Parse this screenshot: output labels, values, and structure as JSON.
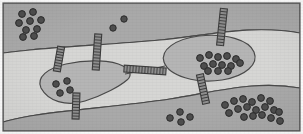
{
  "figure": {
    "width": 303,
    "height": 134,
    "background_color": "#ffffff"
  },
  "colors": {
    "paper": "#ffffff",
    "matrix_dark": "#a9a9a9",
    "corridor_light": "#d6d6d4",
    "patch_fill": "#b5b5b5",
    "outline": "#4a4a4a",
    "frame": "#5a5a5a",
    "dot_fill": "#4e4e4e",
    "dot_outline": "#2b2b2b",
    "crossing_fill": "#8f8f8f",
    "crossing_rung": "#3c3c3c"
  },
  "frame": {
    "x": 3,
    "y": 3,
    "width": 297,
    "height": 128,
    "stroke_width": 1.2
  },
  "regions": [
    {
      "name": "upper-matrix-band",
      "label": "Upper matrix (unsuitable habitat)",
      "shade": "dark",
      "path": "M3,3 L300,3 L300,33 C250,24 205,36 160,40 C118,44 70,46 30,50 C20,51 11,52 3,53 Z"
    },
    {
      "name": "central-corridor-band",
      "label": "Central corridor band (suitable habitat)",
      "shade": "light",
      "path": "M3,53 C11,52 20,51 30,50 C70,46 118,44 160,40 C205,36 250,24 300,33 L300,88 C255,80 215,92 170,99 C125,106 65,110 30,116 C19,118 10,120 3,122 Z"
    },
    {
      "name": "lower-matrix-band",
      "label": "Lower matrix (unsuitable habitat)",
      "shade": "dark",
      "path": "M3,122 C10,120 19,118 30,116 C65,110 125,106 170,99 C215,92 255,80 300,88 L300,131 L3,131 Z"
    }
  ],
  "patches": [
    {
      "name": "left-habitat-patch",
      "label": "Left habitat patch",
      "path": "M41,88 C36,77 48,68 66,64 C88,59 112,60 123,66 C131,70 132,76 127,80 C120,86 104,95 85,101 C66,107 48,101 41,88 Z",
      "dot_count": 4
    },
    {
      "name": "right-habitat-patch",
      "label": "Right habitat patch",
      "path": "M164,62 C160,50 175,39 199,36 C226,33 249,40 254,52 C259,64 246,76 222,80 C196,84 169,76 164,62 Z",
      "dot_count": 13
    }
  ],
  "corridor_link": {
    "name": "inter-patch-corridor",
    "label": "Corridor connecting the two patches",
    "path": "M125,74 C137,72 152,69 165,66"
  },
  "crossings": [
    {
      "name": "crossing-structure-1",
      "label": "Crossing structure 1",
      "cx": 59,
      "cy": 59,
      "angle": 10,
      "length": 25,
      "width": 7,
      "rungs": 9
    },
    {
      "name": "crossing-structure-2",
      "label": "Crossing structure 2",
      "cx": 97,
      "cy": 52,
      "angle": 4,
      "length": 36,
      "width": 7,
      "rungs": 12
    },
    {
      "name": "crossing-structure-3",
      "label": "Crossing structure 3",
      "cx": 76,
      "cy": 106,
      "angle": 2,
      "length": 26,
      "width": 7,
      "rungs": 9
    },
    {
      "name": "crossing-structure-4",
      "label": "Crossing structure 4 (inter-patch bridge)",
      "cx": 145,
      "cy": 70,
      "angle": 94,
      "length": 42,
      "width": 7,
      "rungs": 14
    },
    {
      "name": "crossing-structure-5",
      "label": "Crossing structure 5",
      "cx": 222,
      "cy": 27,
      "angle": 6,
      "length": 37,
      "width": 7,
      "rungs": 12
    },
    {
      "name": "crossing-structure-6",
      "label": "Crossing structure 6",
      "cx": 203,
      "cy": 89,
      "angle": -12,
      "length": 30,
      "width": 7,
      "rungs": 10
    }
  ],
  "dot_groups": [
    {
      "name": "dot-cluster-upper-left",
      "label": "Population cluster, upper-left matrix",
      "count": 9,
      "radius": 3.4,
      "points": [
        [
          22,
          14
        ],
        [
          33,
          12
        ],
        [
          19,
          23
        ],
        [
          30,
          21
        ],
        [
          41,
          20
        ],
        [
          26,
          30
        ],
        [
          37,
          29
        ],
        [
          23,
          37
        ],
        [
          34,
          36
        ]
      ]
    },
    {
      "name": "dot-pair-upper-center",
      "label": "Scattered individuals, upper-center matrix",
      "count": 2,
      "radius": 3.2,
      "points": [
        [
          124,
          19
        ],
        [
          113,
          28
        ]
      ]
    },
    {
      "name": "dot-cluster-left-patch",
      "label": "Population inside left habitat patch",
      "count": 4,
      "radius": 3.3,
      "points": [
        [
          56,
          84
        ],
        [
          67,
          81
        ],
        [
          60,
          93
        ],
        [
          70,
          90
        ]
      ]
    },
    {
      "name": "dot-cluster-right-patch",
      "label": "Population inside right habitat patch",
      "count": 13,
      "radius": 3.4,
      "points": [
        [
          200,
          58
        ],
        [
          209,
          55
        ],
        [
          218,
          57
        ],
        [
          227,
          56
        ],
        [
          236,
          59
        ],
        [
          204,
          66
        ],
        [
          213,
          64
        ],
        [
          222,
          65
        ],
        [
          231,
          66
        ],
        [
          240,
          63
        ],
        [
          208,
          71
        ],
        [
          218,
          71
        ],
        [
          228,
          71
        ]
      ]
    },
    {
      "name": "dot-cluster-lower-center",
      "label": "Small population, lower-center matrix",
      "count": 4,
      "radius": 3.3,
      "points": [
        [
          170,
          118
        ],
        [
          180,
          112
        ],
        [
          181,
          122
        ],
        [
          190,
          117
        ]
      ]
    },
    {
      "name": "dot-cluster-lower-right",
      "label": "Large population cluster, lower-right matrix",
      "count": 18,
      "radius": 3.4,
      "points": [
        [
          225,
          105
        ],
        [
          234,
          101
        ],
        [
          243,
          99
        ],
        [
          252,
          102
        ],
        [
          261,
          98
        ],
        [
          270,
          101
        ],
        [
          229,
          113
        ],
        [
          238,
          109
        ],
        [
          247,
          107
        ],
        [
          256,
          110
        ],
        [
          265,
          107
        ],
        [
          274,
          110
        ],
        [
          244,
          117
        ],
        [
          253,
          116
        ],
        [
          262,
          115
        ],
        [
          271,
          118
        ],
        [
          279,
          112
        ],
        [
          280,
          121
        ]
      ]
    }
  ]
}
